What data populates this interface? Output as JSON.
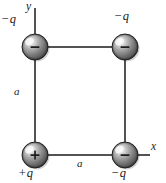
{
  "figure": {
    "background_color": "#ffffff",
    "line_color": "#1a1a1a",
    "sphere_color_light": "#e8e8e8",
    "sphere_color_mid": "#9a9a9a",
    "sphere_color_dark": "#3a3a3a",
    "sphere_outline_color": "#2b2b2b"
  },
  "axes": {
    "y_axis": {
      "label": "y",
      "label_x": 29,
      "label_y": 2,
      "line_x": 35,
      "line_y_top": 8,
      "line_y_bottom": 47
    },
    "x_axis": {
      "label": "x",
      "label_x": 152,
      "label_y": 143,
      "line_y": 155,
      "line_x_left": 125,
      "line_x_right": 150
    }
  },
  "square": {
    "left": 35,
    "top": 47,
    "right": 125,
    "bottom": 155,
    "side_label_vertical": {
      "text": "a",
      "x": 14,
      "y": 88
    },
    "side_label_horizontal": {
      "text": "a",
      "x": 77,
      "y": 159
    }
  },
  "charges": [
    {
      "id": "top-left",
      "label": "−q",
      "sign_glyph": "−",
      "sign": "negative",
      "cx": 35,
      "cy": 47,
      "radius": 13,
      "label_x": 1,
      "label_y": 13
    },
    {
      "id": "top-right",
      "label": "−q",
      "sign_glyph": "−",
      "sign": "negative",
      "cx": 125,
      "cy": 47,
      "radius": 13,
      "label_x": 115,
      "label_y": 11
    },
    {
      "id": "bottom-left",
      "label": "+q",
      "sign_glyph": "+",
      "sign": "positive",
      "cx": 35,
      "cy": 155,
      "radius": 13,
      "label_x": 19,
      "label_y": 169
    },
    {
      "id": "bottom-right",
      "label": "−q",
      "sign_glyph": "−",
      "sign": "negative",
      "cx": 125,
      "cy": 155,
      "radius": 13,
      "label_x": 112,
      "label_y": 169
    }
  ]
}
